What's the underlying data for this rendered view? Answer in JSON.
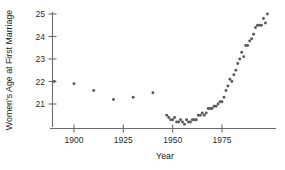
{
  "chart_data": {
    "type": "scatter",
    "title": "",
    "xlabel": "Year",
    "ylabel": "Women's Age at First Marriage",
    "xlim": [
      1888,
      2000
    ],
    "ylim": [
      20.1,
      25.2
    ],
    "xticks": [
      1900,
      1925,
      1950,
      1975
    ],
    "xticklabels": [
      "1900",
      "1925",
      "1950",
      "1975"
    ],
    "yticks": [
      21,
      22,
      23,
      24,
      25
    ],
    "yticklabels": [
      "21",
      "22",
      "23",
      "24",
      "25"
    ],
    "grid": false,
    "legend": null,
    "marker": "filled-circle",
    "marker_color": "#5a5a5a",
    "axis_color": "#6b6b6b",
    "series": [
      {
        "name": "Median age at first marriage, women",
        "x": [
          1890,
          1900,
          1910,
          1920,
          1930,
          1940,
          1947,
          1948,
          1949,
          1950,
          1951,
          1952,
          1953,
          1954,
          1955,
          1956,
          1957,
          1958,
          1959,
          1960,
          1961,
          1962,
          1963,
          1964,
          1965,
          1966,
          1967,
          1968,
          1969,
          1970,
          1971,
          1972,
          1973,
          1974,
          1975,
          1976,
          1977,
          1978,
          1979,
          1980,
          1981,
          1982,
          1983,
          1984,
          1985,
          1986,
          1987,
          1988,
          1989,
          1990,
          1991,
          1992,
          1993,
          1994,
          1995,
          1996,
          1997,
          1998
        ],
        "y": [
          22.0,
          21.9,
          21.6,
          21.2,
          21.3,
          21.5,
          20.5,
          20.4,
          20.3,
          20.3,
          20.4,
          20.2,
          20.2,
          20.3,
          20.2,
          20.1,
          20.3,
          20.2,
          20.2,
          20.3,
          20.3,
          20.3,
          20.5,
          20.5,
          20.6,
          20.5,
          20.6,
          20.8,
          20.8,
          20.8,
          20.9,
          20.9,
          21.0,
          21.1,
          21.1,
          21.3,
          21.6,
          21.8,
          22.1,
          22.0,
          22.3,
          22.5,
          22.8,
          23.0,
          23.3,
          23.1,
          23.6,
          23.6,
          23.8,
          23.9,
          24.1,
          24.4,
          24.5,
          24.5,
          24.5,
          24.8,
          24.6,
          25.0
        ]
      }
    ]
  },
  "axes": {
    "x_title": "Year",
    "y_title": "Women's Age at First Marriage"
  }
}
